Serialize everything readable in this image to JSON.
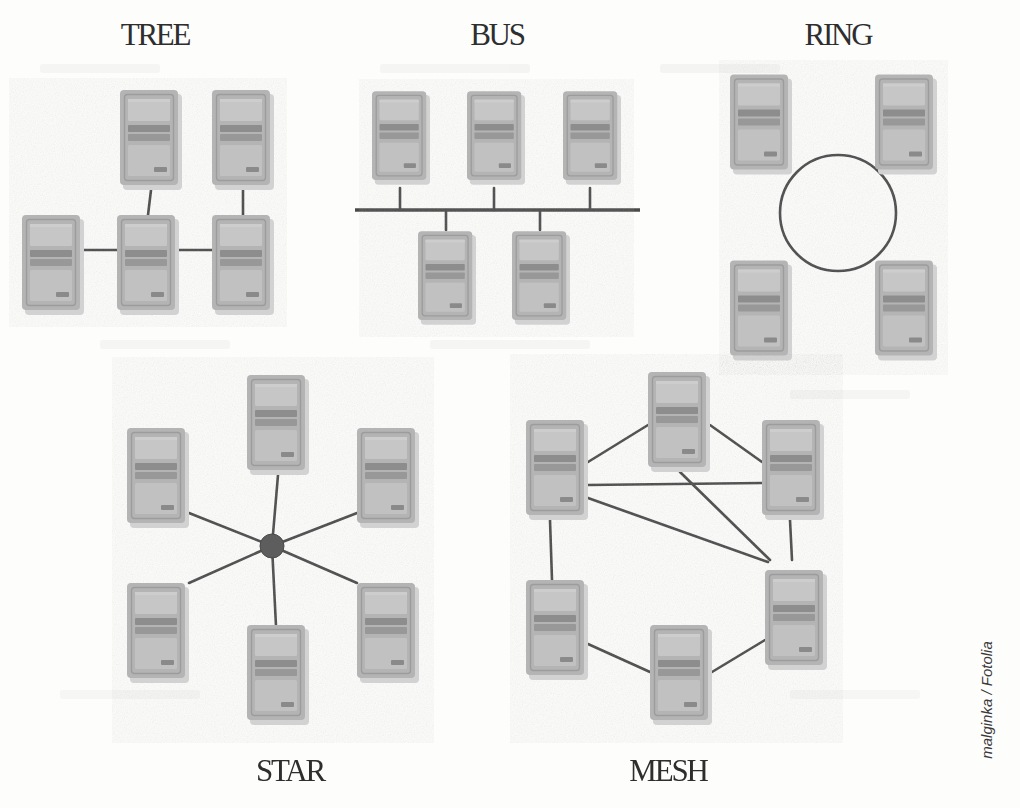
{
  "image": {
    "width": 1020,
    "height": 808,
    "background_color": "#fdfdfc",
    "subject": "network topology diagram",
    "style": "scanned grayscale textbook illustration"
  },
  "watermark": {
    "text": "malginka / Fotolia",
    "position": "right edge, rotated 90 degrees",
    "color": "#3a3a3a"
  },
  "colors": {
    "line": "#4a4a4a",
    "hub": "#5d5d5d",
    "title": "#2e2e2e",
    "pc_body": "#b9b9b9",
    "pc_body_dark": "#a2a2a2",
    "pc_panel": "#c7c7c7",
    "pc_slot": "#8f8f8f",
    "pc_shadow": "#cfcfcf"
  },
  "pc_icon": {
    "name": "desktop-computer-tower",
    "width": 62,
    "height": 100,
    "description": "grey tower PC front face with bezel, upper panel, two drive slots and lower panel"
  },
  "topologies": [
    {
      "id": "tree",
      "label": "TREE",
      "label_position": "top",
      "label_x": 155,
      "label_y": 45,
      "node_count": 5,
      "nodes": [
        {
          "id": "t1",
          "x": 120,
          "y": 90
        },
        {
          "id": "t2",
          "x": 212,
          "y": 90
        },
        {
          "id": "t3",
          "x": 22,
          "y": 215
        },
        {
          "id": "t4",
          "x": 117,
          "y": 215
        },
        {
          "id": "t5",
          "x": 212,
          "y": 215
        }
      ],
      "edges": [
        {
          "from": "t1",
          "to": "t4"
        },
        {
          "from": "t2",
          "to": "t5"
        },
        {
          "from": "t3",
          "to": "t4"
        },
        {
          "from": "t4",
          "to": "t5"
        }
      ]
    },
    {
      "id": "bus",
      "label": "BUS",
      "label_position": "top",
      "label_x": 497,
      "label_y": 45,
      "node_count": 5,
      "backbone": {
        "x1": 355,
        "y1": 210,
        "x2": 640,
        "y2": 210
      },
      "nodes": [
        {
          "id": "b1",
          "x": 372,
          "y": 88,
          "drop_from": "bottom"
        },
        {
          "id": "b2",
          "x": 467,
          "y": 88,
          "drop_from": "bottom"
        },
        {
          "id": "b3",
          "x": 563,
          "y": 88,
          "drop_from": "bottom"
        },
        {
          "id": "b4",
          "x": 418,
          "y": 228,
          "drop_from": "top"
        },
        {
          "id": "b5",
          "x": 512,
          "y": 228,
          "drop_from": "top"
        }
      ]
    },
    {
      "id": "ring",
      "label": "RING",
      "label_position": "top",
      "label_x": 838,
      "label_y": 45,
      "node_count": 4,
      "circle": {
        "cx": 838,
        "cy": 213,
        "r": 58
      },
      "nodes": [
        {
          "id": "r1",
          "x": 730,
          "y": 72
        },
        {
          "id": "r2",
          "x": 875,
          "y": 72
        },
        {
          "id": "r3",
          "x": 730,
          "y": 258
        },
        {
          "id": "r4",
          "x": 875,
          "y": 258
        }
      ]
    },
    {
      "id": "star",
      "label": "STAR",
      "label_position": "bottom",
      "label_x": 290,
      "label_y": 781,
      "node_count": 6,
      "hub": {
        "cx": 272,
        "cy": 546,
        "r": 12
      },
      "nodes": [
        {
          "id": "s1",
          "x": 247,
          "y": 375,
          "anchor_x": 278,
          "anchor_y": 475
        },
        {
          "id": "s2",
          "x": 127,
          "y": 428,
          "anchor_x": 189,
          "anchor_y": 513
        },
        {
          "id": "s3",
          "x": 357,
          "y": 428,
          "anchor_x": 357,
          "anchor_y": 513
        },
        {
          "id": "s4",
          "x": 127,
          "y": 583,
          "anchor_x": 189,
          "anchor_y": 583
        },
        {
          "id": "s5",
          "x": 357,
          "y": 583,
          "anchor_x": 357,
          "anchor_y": 583
        },
        {
          "id": "s6",
          "x": 247,
          "y": 625,
          "anchor_x": 278,
          "anchor_y": 625
        }
      ]
    },
    {
      "id": "mesh",
      "label": "MESH",
      "label_position": "bottom",
      "label_x": 668,
      "label_y": 781,
      "node_count": 6,
      "nodes": [
        {
          "id": "m1",
          "x": 648,
          "y": 372
        },
        {
          "id": "m2",
          "x": 526,
          "y": 420
        },
        {
          "id": "m3",
          "x": 762,
          "y": 420
        },
        {
          "id": "m4",
          "x": 526,
          "y": 580
        },
        {
          "id": "m5",
          "x": 650,
          "y": 625
        },
        {
          "id": "m6",
          "x": 765,
          "y": 560
        }
      ],
      "edges": [
        {
          "from": "m2",
          "to": "m1"
        },
        {
          "from": "m1",
          "to": "m3"
        },
        {
          "from": "m2",
          "to": "m3"
        },
        {
          "from": "m1",
          "to": "m6"
        },
        {
          "from": "m2",
          "to": "m6"
        },
        {
          "from": "m3",
          "to": "m6"
        },
        {
          "from": "m2",
          "to": "m4"
        },
        {
          "from": "m4",
          "to": "m5"
        },
        {
          "from": "m5",
          "to": "m6"
        }
      ]
    }
  ],
  "bleed_through": [
    {
      "text": "faint reverse-page text",
      "x": 60,
      "y": 78
    },
    {
      "text": "faint reverse-page text",
      "x": 400,
      "y": 78
    },
    {
      "text": "faint reverse-page text",
      "x": 700,
      "y": 78
    },
    {
      "text": "faint reverse-page text",
      "x": 120,
      "y": 350
    },
    {
      "text": "faint reverse-page text",
      "x": 470,
      "y": 350
    },
    {
      "text": "faint reverse-page text",
      "x": 830,
      "y": 400
    },
    {
      "text": "faint reverse-page text",
      "x": 80,
      "y": 700
    },
    {
      "text": "faint reverse-page text",
      "x": 830,
      "y": 700
    }
  ]
}
